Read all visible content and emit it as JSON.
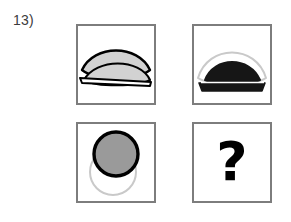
{
  "puzzle": {
    "number_label": "13)",
    "type": "visual-analogy-matrix",
    "rows": 2,
    "columns": 2,
    "answer_placeholder": "?"
  },
  "colors": {
    "panel_border": "#7d7d7d",
    "panel_background": "#ffffff",
    "outline_dark": "#000000",
    "outline_light": "#c9c9c9",
    "fill_light_gray": "#d2d2d2",
    "fill_medium_gray": "#9a9a9a",
    "fill_near_black": "#161616",
    "label_text": "#3c3c3c"
  },
  "cells": [
    {
      "id": "cell-top-left",
      "position": "top-left",
      "description": "Two overlapping lens (vesica) shapes with light gray fill and black outlines, plus a horizontal baseline",
      "shapes": [
        {
          "name": "upper-lens",
          "fill": "#d2d2d2",
          "stroke": "#000000",
          "stroke_width": 2
        },
        {
          "name": "lower-lens",
          "fill": "#d2d2d2",
          "stroke": "#000000",
          "stroke_width": 2
        },
        {
          "name": "baseline",
          "stroke": "#000000",
          "stroke_width": 2
        }
      ]
    },
    {
      "id": "cell-top-right",
      "position": "top-right",
      "description": "A near-black filled lens shape in front of a light gray outlined lens arc, plus a dark baseline band",
      "shapes": [
        {
          "name": "back-lens-outline",
          "fill": "none",
          "stroke": "#c9c9c9",
          "stroke_width": 2
        },
        {
          "name": "front-lens-filled",
          "fill": "#161616",
          "stroke": "#161616",
          "stroke_width": 2
        },
        {
          "name": "baseline-band",
          "fill": "#161616",
          "stroke": "#161616",
          "stroke_width": 2
        }
      ]
    },
    {
      "id": "cell-bottom-left",
      "position": "bottom-left",
      "description": "A medium gray filled circle with a thick black outline overlapping a light gray outlined circle below it",
      "shapes": [
        {
          "name": "back-circle-outline",
          "fill": "none",
          "stroke": "#c9c9c9",
          "stroke_width": 2
        },
        {
          "name": "front-circle-filled",
          "fill": "#9a9a9a",
          "stroke": "#000000",
          "stroke_width": 4
        }
      ]
    },
    {
      "id": "cell-bottom-right",
      "position": "bottom-right",
      "description": "Answer cell containing a large bold question mark",
      "shapes": [
        {
          "name": "question-mark-glyph",
          "fill": "#000000"
        }
      ]
    }
  ]
}
